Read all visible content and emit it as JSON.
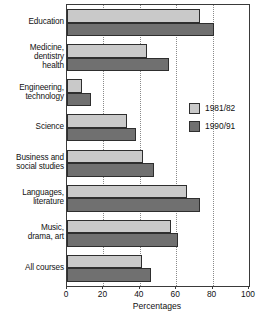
{
  "chart_data": {
    "type": "bar",
    "orientation": "horizontal",
    "title": "",
    "xlabel": "Percentages",
    "ylabel": "",
    "xlim": [
      0,
      100
    ],
    "xticks": [
      0,
      20,
      40,
      60,
      80,
      100
    ],
    "grid": "vertical-dotted",
    "legend_position": "inside-right",
    "categories": [
      "Education",
      "Medicine,\ndentistry\nhealth",
      "Engineering,\ntechnology",
      "Science",
      "Business and\nsocial studies",
      "Languages,\nliterature",
      "Music,\ndrama, art",
      "All courses"
    ],
    "series": [
      {
        "name": "1981/82",
        "color": "#c9c9c9",
        "values": [
          73,
          44,
          8,
          33,
          42,
          66,
          57,
          41
        ]
      },
      {
        "name": "1990/91",
        "color": "#707070",
        "values": [
          81,
          56,
          13,
          38,
          48,
          73,
          61,
          46
        ]
      }
    ]
  },
  "axis": {
    "x_label": "Percentages",
    "tick_labels": [
      "0",
      "20",
      "40",
      "60",
      "80",
      "100"
    ]
  },
  "legend": {
    "items": [
      {
        "label": "1981/82",
        "swatch": "#c9c9c9"
      },
      {
        "label": "1990/91",
        "swatch": "#707070"
      }
    ]
  },
  "style": {
    "bar_light": "#c9c9c9",
    "bar_dark": "#707070",
    "bar_outline": "#2e2e2e",
    "frame": "#3a3a3a",
    "gridline": "#8a8a8a",
    "background": "#ffffff",
    "text": "#111111"
  }
}
